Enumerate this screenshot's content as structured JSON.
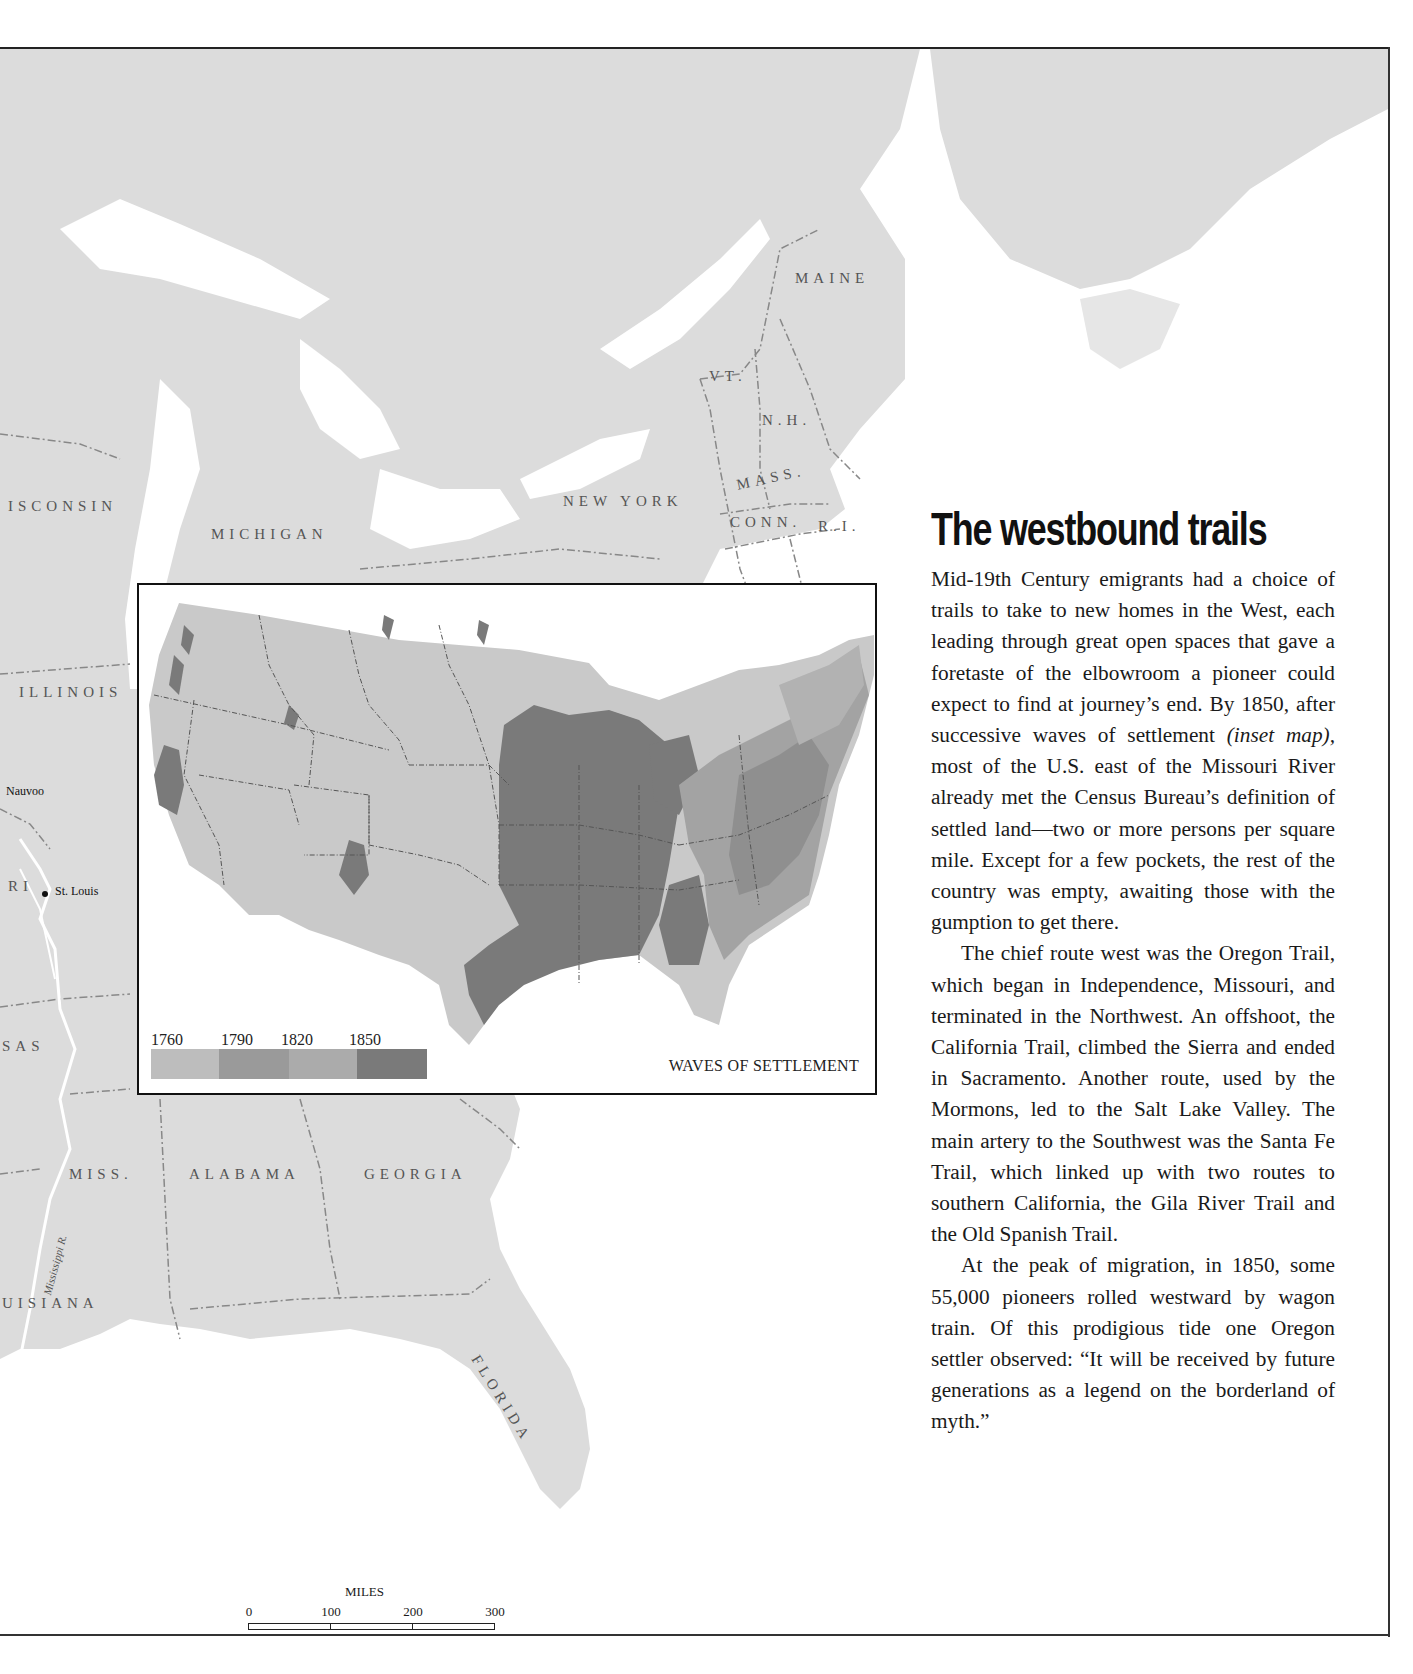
{
  "map": {
    "state_labels": [
      {
        "id": "maine",
        "text": "MAINE",
        "x": 795,
        "y": 280,
        "rot": 0
      },
      {
        "id": "vt",
        "text": "VT.",
        "x": 709,
        "y": 378,
        "rot": 0
      },
      {
        "id": "nh",
        "text": "N.H.",
        "x": 762,
        "y": 422,
        "rot": 0
      },
      {
        "id": "mass",
        "text": "MASS.",
        "x": 735,
        "y": 487,
        "rot": -12
      },
      {
        "id": "conn",
        "text": "CONN.",
        "x": 730,
        "y": 524,
        "rot": 0
      },
      {
        "id": "ri",
        "text": "R.I.",
        "x": 818,
        "y": 528,
        "rot": 0
      },
      {
        "id": "new-york",
        "text": "NEW YORK",
        "x": 563,
        "y": 503,
        "rot": 0
      },
      {
        "id": "michigan",
        "text": "MICHIGAN",
        "x": 211,
        "y": 536,
        "rot": 0
      },
      {
        "id": "wisconsin",
        "text": "ISCONSIN",
        "x": 8,
        "y": 508,
        "rot": 0
      },
      {
        "id": "illinois",
        "text": "ILLINOIS",
        "x": 19,
        "y": 694,
        "rot": 0
      },
      {
        "id": "missouri",
        "text": "RI",
        "x": 8,
        "y": 888,
        "rot": 0
      },
      {
        "id": "arkansas",
        "text": "SAS",
        "x": 2,
        "y": 1048,
        "rot": 0
      },
      {
        "id": "miss",
        "text": "MISS.",
        "x": 69,
        "y": 1176,
        "rot": 0
      },
      {
        "id": "alabama",
        "text": "ALABAMA",
        "x": 189,
        "y": 1176,
        "rot": 0
      },
      {
        "id": "georgia",
        "text": "GEORGIA",
        "x": 364,
        "y": 1176,
        "rot": 0
      },
      {
        "id": "louisiana",
        "text": "UISIANA",
        "x": 2,
        "y": 1305,
        "rot": 0
      },
      {
        "id": "florida",
        "text": "FLORIDA",
        "x": 482,
        "y": 1362,
        "rot": 58
      }
    ],
    "river_label": "Mississippi R.",
    "cities": [
      {
        "id": "nauvoo",
        "name": "Nauvoo",
        "x": 6,
        "y": 741,
        "dot": false
      },
      {
        "id": "st-louis",
        "name": "St. Louis",
        "x": 55,
        "y": 840,
        "dot": true
      }
    ],
    "scale": {
      "title": "MILES",
      "ticks": [
        "0",
        "100",
        "200",
        "300"
      ]
    }
  },
  "inset": {
    "title": "WAVES OF SETTLEMENT",
    "legend": [
      {
        "year": "1760",
        "color": "#bdbdbd"
      },
      {
        "year": "1790",
        "color": "#9a9a9a"
      },
      {
        "year": "1820",
        "color": "#ababab"
      },
      {
        "year": "1850",
        "color": "#7a7a7a"
      }
    ]
  },
  "colors": {
    "land": "#dcdcdc",
    "water": "#ffffff",
    "border": "#7a7a7a",
    "text": "#1a1a1a"
  },
  "article": {
    "title": "The westbound trails",
    "p1_a": "Mid-19th Century emigrants had a choice of trails to take to new homes in the West, each leading through great open spaces that gave a foretaste of the elbowroom a pioneer could expect to find at journey’s end. By 1850, after successive waves of settlement ",
    "p1_italic": "(inset map),",
    "p1_b": " most of the U.S. east of the Missouri River already met the Census Bureau’s definition of settled land—two or more persons per square mile. Except for a few pockets, the rest of the country was empty, awaiting those with the gumption to get there.",
    "p2": "The chief route west was the Oregon Trail, which began in Independence, Missouri, and terminated in the Northwest. An offshoot, the California Trail, climbed the Sierra and ended in Sacramento. Another route, used by the Mormons, led to the Salt Lake Valley. The main artery to the Southwest was the Santa Fe Trail, which linked up with two routes to southern California, the Gila River Trail and the Old Spanish Trail.",
    "p3": "At the peak of migration, in 1850, some 55,000 pioneers rolled westward by wagon train. Of this prodigious tide one Oregon settler observed: “It will be received by future generations as a legend on the borderland of myth.”"
  }
}
